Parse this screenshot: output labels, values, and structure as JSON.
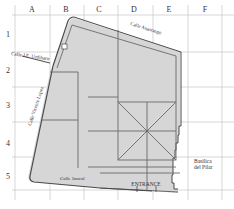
{
  "map": {
    "columns": [
      "A",
      "B",
      "C",
      "D",
      "E",
      "F"
    ],
    "rows": [
      "1",
      "2",
      "3",
      "4",
      "5"
    ],
    "streets": {
      "top": "Calle Anastasgo",
      "top_left": "Calle J.E. Urdibarn",
      "left": "Calle Vicente Lopez",
      "bottom": "Calle Juncal"
    },
    "landmarks": {
      "entrance": "ENTRANCE",
      "basilica_line1": "Basilica",
      "basilica_line2": "del Pilar"
    },
    "colors": {
      "grid": "#bdbdbd",
      "fill": "#d6d6d6",
      "outline": "#4a4a4a",
      "paths": "#6a6a6a",
      "background": "#ffffff"
    }
  }
}
